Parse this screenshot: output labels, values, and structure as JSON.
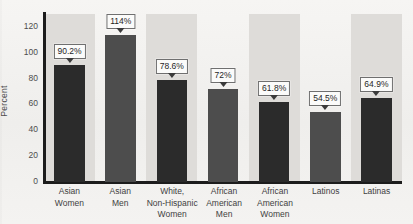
{
  "chart_data": {
    "type": "bar",
    "title": "",
    "xlabel": "",
    "ylabel": "Percent",
    "ylim": [
      0,
      130
    ],
    "yticks": [
      "0",
      "20",
      "40",
      "60",
      "80",
      "100",
      "120"
    ],
    "grid": false,
    "legend": "none",
    "categories": [
      "Asian Women",
      "Asian Men",
      "White, Non-Hispanic Women",
      "African American Men",
      "African American Women",
      "Latinos",
      "Latinas"
    ],
    "category_lines": [
      [
        "Asian",
        "Women"
      ],
      [
        "Asian",
        "Men"
      ],
      [
        "White,",
        "Non-Hispanic",
        "Women"
      ],
      [
        "African",
        "American",
        "Men"
      ],
      [
        "African",
        "American",
        "Women"
      ],
      [
        "Latinos"
      ],
      [
        "Latinas"
      ]
    ],
    "values": [
      90.2,
      114,
      78.6,
      72,
      61.8,
      54.5,
      64.9
    ],
    "data_labels": [
      "90.2%",
      "114%",
      "78.6%",
      "72%",
      "61.8%",
      "54.5%",
      "64.9%"
    ],
    "bar_colors": [
      "#2b2b2b",
      "#4d4d4d",
      "#2b2b2b",
      "#4d4d4d",
      "#2b2b2b",
      "#4d4d4d",
      "#2b2b2b"
    ],
    "band_color": "#dedcd9",
    "axis_color": "#1c1c1c",
    "background_color": "#f4f3f1"
  }
}
